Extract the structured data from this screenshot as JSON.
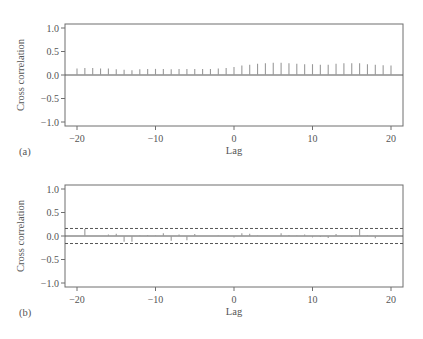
{
  "chart_data": [
    {
      "type": "bar",
      "panel": "(a)",
      "title": "",
      "xlabel": "Lag",
      "ylabel": "Cross correlation",
      "xlim": [
        -21.5,
        21.5
      ],
      "ylim": [
        -1.08,
        1.08
      ],
      "xticks": [
        -20,
        -10,
        0,
        10,
        20
      ],
      "xtick_labels": [
        "−20",
        "−10",
        "0",
        "10",
        "20"
      ],
      "yticks": [
        1.0,
        0.5,
        0.0,
        -0.5,
        -1.0
      ],
      "ytick_labels": [
        "1.0",
        "0.5",
        "0.0",
        "−0.5",
        "−1.0"
      ],
      "grid": false,
      "confidence_bounds": null,
      "x": [
        -20,
        -19,
        -18,
        -17,
        -16,
        -15,
        -14,
        -13,
        -12,
        -11,
        -10,
        -9,
        -8,
        -7,
        -6,
        -5,
        -4,
        -3,
        -2,
        -1,
        0,
        1,
        2,
        3,
        4,
        5,
        6,
        7,
        8,
        9,
        10,
        11,
        12,
        13,
        14,
        15,
        16,
        17,
        18,
        19,
        20
      ],
      "values": [
        0.14,
        0.15,
        0.15,
        0.14,
        0.14,
        0.12,
        0.11,
        0.1,
        0.12,
        0.13,
        0.13,
        0.13,
        0.12,
        0.13,
        0.13,
        0.13,
        0.13,
        0.13,
        0.14,
        0.15,
        0.17,
        0.2,
        0.22,
        0.24,
        0.25,
        0.26,
        0.26,
        0.25,
        0.24,
        0.23,
        0.23,
        0.22,
        0.22,
        0.24,
        0.25,
        0.25,
        0.25,
        0.23,
        0.22,
        0.21,
        0.2
      ]
    },
    {
      "type": "bar",
      "panel": "(b)",
      "title": "",
      "xlabel": "Lag",
      "ylabel": "Cross correlation",
      "xlim": [
        -21.5,
        21.5
      ],
      "ylim": [
        -1.08,
        1.08
      ],
      "xticks": [
        -20,
        -10,
        0,
        10,
        20
      ],
      "xtick_labels": [
        "−20",
        "−10",
        "0",
        "10",
        "20"
      ],
      "yticks": [
        1.0,
        0.5,
        0.0,
        -0.5,
        -1.0
      ],
      "ytick_labels": [
        "1.0",
        "0.5",
        "0.0",
        "−0.5",
        "−1.0"
      ],
      "grid": false,
      "confidence_bounds": [
        -0.16,
        0.16
      ],
      "x": [
        -20,
        -19,
        -18,
        -17,
        -16,
        -15,
        -14,
        -13,
        -12,
        -11,
        -10,
        -9,
        -8,
        -7,
        -6,
        -5,
        -4,
        -3,
        -2,
        -1,
        0,
        1,
        2,
        3,
        4,
        5,
        6,
        7,
        8,
        9,
        10,
        11,
        12,
        13,
        14,
        15,
        16,
        17,
        18,
        19,
        20
      ],
      "values": [
        0.0,
        0.15,
        0.0,
        0.0,
        0.03,
        0.05,
        -0.12,
        -0.12,
        0.01,
        0.02,
        0.01,
        0.06,
        -0.1,
        0.03,
        -0.09,
        0.04,
        0.0,
        0.0,
        0.01,
        0.0,
        -0.03,
        0.06,
        0.05,
        0.01,
        0.0,
        0.0,
        0.06,
        0.02,
        0.01,
        0.03,
        -0.03,
        -0.02,
        -0.04,
        0.04,
        0.0,
        -0.02,
        0.15,
        0.01,
        -0.05,
        0.0,
        0.0
      ]
    }
  ],
  "colors": {
    "axis": "#6e6e6e",
    "bars": "#9a9a9a",
    "zero_line": "#555555",
    "bounds": "#555555",
    "text": "#555555"
  }
}
